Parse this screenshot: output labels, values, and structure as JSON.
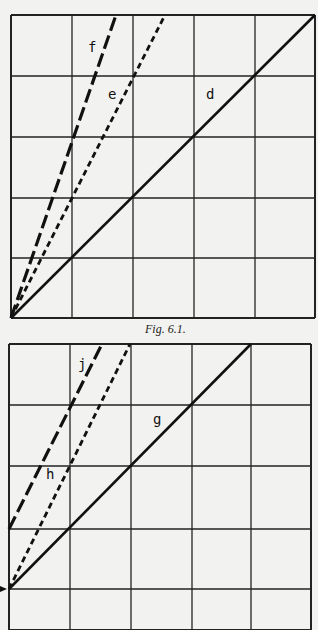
{
  "figures": [
    {
      "id": "fig1",
      "caption": "Fig. 6.1.",
      "grid": {
        "x": [
          11,
          72,
          133,
          194,
          255,
          315
        ],
        "y": [
          15,
          76,
          137,
          198,
          258,
          318
        ]
      },
      "lines": [
        {
          "label": "f",
          "style": "long-dash",
          "x1": 11,
          "y1": 318,
          "x2": 116,
          "y2": 15,
          "label_x": 88,
          "label_y": 52
        },
        {
          "label": "e",
          "style": "short-dash",
          "x1": 11,
          "y1": 318,
          "x2": 165,
          "y2": 15,
          "label_x": 108,
          "label_y": 99
        },
        {
          "label": "d",
          "style": "solid",
          "x1": 11,
          "y1": 318,
          "x2": 315,
          "y2": 15,
          "label_x": 206,
          "label_y": 99
        }
      ]
    },
    {
      "id": "fig2",
      "caption": "",
      "grid": {
        "x": [
          9,
          70,
          131,
          192,
          251,
          311
        ],
        "y": [
          344,
          405,
          466,
          529,
          589,
          630
        ]
      },
      "lines": [
        {
          "label": "j",
          "style": "long-dash",
          "x1": 9,
          "y1": 529,
          "x2": 102,
          "y2": 344,
          "label_x": 78,
          "label_y": 369
        },
        {
          "label": "h",
          "style": "short-dash",
          "x1": 9,
          "y1": 589,
          "x2": 130,
          "y2": 344,
          "label_x": 46,
          "label_y": 479
        },
        {
          "label": "g",
          "style": "solid",
          "x1": 9,
          "y1": 589,
          "x2": 251,
          "y2": 344,
          "label_x": 153,
          "label_y": 424
        }
      ]
    }
  ]
}
